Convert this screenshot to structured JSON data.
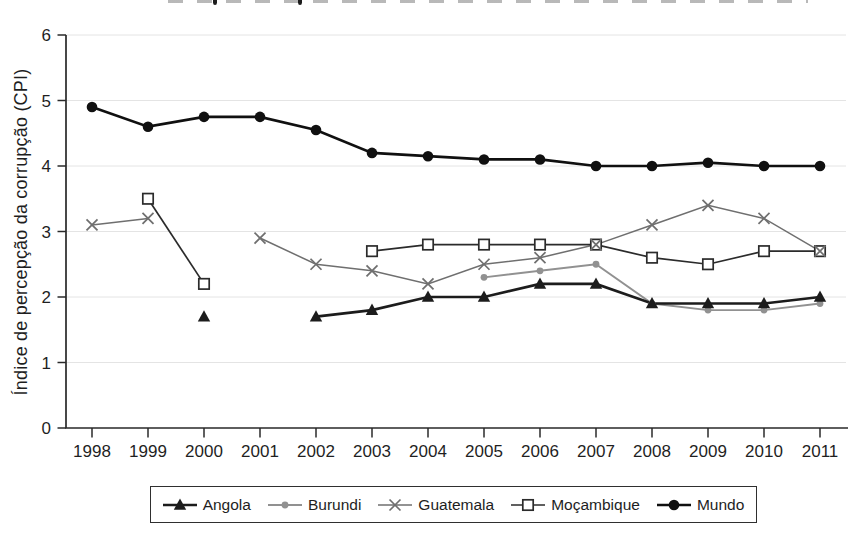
{
  "figure": {
    "background_color": "#ffffff",
    "top_edge_note": "cropped title fragments",
    "y_axis_title": "Índice de percepção da corrupção (CPI)"
  },
  "chart_data": {
    "type": "line",
    "title": "",
    "xlabel": "",
    "ylabel": "Índice de percepção da corrupção (CPI)",
    "x": [
      "1998",
      "1999",
      "2000",
      "2001",
      "2002",
      "2003",
      "2004",
      "2005",
      "2006",
      "2007",
      "2008",
      "2009",
      "2010",
      "2011"
    ],
    "ylim": [
      0,
      6
    ],
    "yticks": [
      0,
      1,
      2,
      3,
      4,
      5,
      6
    ],
    "grid": {
      "horizontal": true,
      "color": "#e4e4e4"
    },
    "legend": {
      "position": "bottom",
      "entries": [
        "Angola",
        "Burundi",
        "Guatemala",
        "Moçambique",
        "Mundo"
      ]
    },
    "axis_color": "#2a2a2a",
    "series": [
      {
        "name": "Angola",
        "marker": "filled-triangle",
        "color": "#1c1c1c",
        "values": [
          null,
          null,
          1.7,
          null,
          1.7,
          1.8,
          2.0,
          2.0,
          2.2,
          2.2,
          1.9,
          1.9,
          1.9,
          2.0
        ]
      },
      {
        "name": "Burundi",
        "marker": "small-filled-circle",
        "color": "#919191",
        "values": [
          null,
          null,
          null,
          null,
          null,
          null,
          null,
          2.3,
          2.4,
          2.5,
          1.9,
          1.8,
          1.8,
          1.9
        ]
      },
      {
        "name": "Guatemala",
        "marker": "x-cross",
        "color": "#6f6f6f",
        "values": [
          3.1,
          3.2,
          null,
          2.9,
          2.5,
          2.4,
          2.2,
          2.5,
          2.6,
          2.8,
          3.1,
          3.4,
          3.2,
          2.7
        ]
      },
      {
        "name": "Moçambique",
        "marker": "open-square",
        "color": "#2b2b2b",
        "values": [
          null,
          3.5,
          2.2,
          null,
          null,
          2.7,
          2.8,
          2.8,
          2.8,
          2.8,
          2.6,
          2.5,
          2.7,
          2.7
        ]
      },
      {
        "name": "Mundo",
        "marker": "filled-circle",
        "color": "#101010",
        "values": [
          4.9,
          4.6,
          4.75,
          4.75,
          4.55,
          4.2,
          4.15,
          4.1,
          4.1,
          4.0,
          4.0,
          4.05,
          4.0,
          4.0
        ]
      }
    ]
  }
}
